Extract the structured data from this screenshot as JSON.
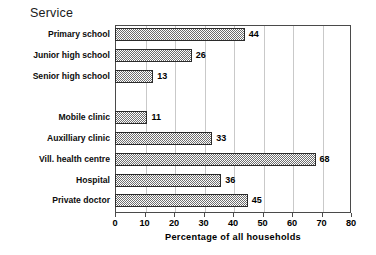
{
  "chart_data": {
    "type": "bar",
    "orientation": "horizontal",
    "title": "Service",
    "xlabel": "Percentage of all households",
    "ylabel": "",
    "xlim": [
      0,
      80
    ],
    "xticks": [
      0,
      10,
      20,
      30,
      40,
      50,
      60,
      70,
      80
    ],
    "grid": "vertical",
    "legend": "none",
    "categories": [
      "Primary school",
      "Junior high school",
      "Senior high school",
      "",
      "Mobile clinic",
      "Auxilliary clinic",
      "Vill. health centre",
      "Hospital",
      "Private doctor"
    ],
    "values": [
      44,
      26,
      13,
      null,
      11,
      33,
      68,
      36,
      45
    ],
    "value_labels": [
      "44",
      "26",
      "13",
      "",
      "11",
      "33",
      "68",
      "36",
      "45"
    ],
    "bar_fill": "checkered-gray-hatch",
    "bar_edge_color": "#2b2b2b",
    "grid_color": "#c9c9c9",
    "frame_color": "#4a4a4a"
  }
}
